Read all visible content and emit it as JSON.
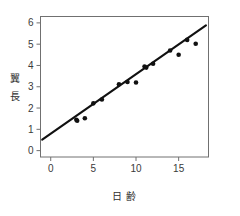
{
  "chart_data": {
    "type": "scatter",
    "title": "",
    "subtitle": "",
    "xlabel": "日 齢",
    "ylabel": "翼 長",
    "xlim": [
      -1.2,
      18.5
    ],
    "ylim": [
      -0.3,
      6.3
    ],
    "xticks": [
      0,
      5,
      10,
      15
    ],
    "xtick_labels": [
      "0",
      "5",
      "10",
      "15"
    ],
    "yticks": [
      0,
      1,
      2,
      3,
      4,
      5,
      6
    ],
    "ytick_labels": [
      "0",
      "1",
      "2",
      "3",
      "4",
      "5",
      "6"
    ],
    "grid": false,
    "legend": "none",
    "frame": "box",
    "marker": "filled-circle",
    "marker_color": "#111111",
    "line_color": "#111111",
    "axis_color": "#666666",
    "background": "#ffffff",
    "x": [
      3.0,
      3.1,
      4.0,
      5.0,
      6.0,
      8.0,
      9.0,
      10.0,
      11.0,
      11.2,
      12.0,
      14.0,
      15.0,
      16.0,
      17.0
    ],
    "y": [
      1.45,
      1.4,
      1.52,
      2.22,
      2.4,
      3.12,
      3.22,
      3.2,
      3.95,
      3.9,
      4.08,
      4.7,
      4.5,
      5.2,
      5.02
    ],
    "points": [
      {
        "x": 3.0,
        "y": 1.45
      },
      {
        "x": 3.1,
        "y": 1.4
      },
      {
        "x": 4.0,
        "y": 1.52
      },
      {
        "x": 5.0,
        "y": 2.22
      },
      {
        "x": 6.0,
        "y": 2.4
      },
      {
        "x": 8.0,
        "y": 3.12
      },
      {
        "x": 9.0,
        "y": 3.22
      },
      {
        "x": 10.0,
        "y": 3.2
      },
      {
        "x": 11.0,
        "y": 3.95
      },
      {
        "x": 11.2,
        "y": 3.9
      },
      {
        "x": 12.0,
        "y": 4.08
      },
      {
        "x": 14.0,
        "y": 4.7
      },
      {
        "x": 15.0,
        "y": 4.5
      },
      {
        "x": 16.0,
        "y": 5.2
      },
      {
        "x": 17.0,
        "y": 5.02
      }
    ],
    "series": [
      {
        "name": "observations",
        "type": "scatter",
        "values": [
          1.45,
          1.4,
          1.52,
          2.22,
          2.4,
          3.12,
          3.22,
          3.2,
          3.95,
          3.9,
          4.08,
          4.7,
          4.5,
          5.2,
          5.02
        ]
      },
      {
        "name": "regression-line",
        "type": "line",
        "x_endpoints": [
          -1.0,
          18.2
        ],
        "y_endpoints": [
          0.52,
          5.88
        ]
      }
    ],
    "regression": {
      "x_start": -1.0,
      "y_start": 0.52,
      "x_end": 18.2,
      "y_end": 5.88
    }
  }
}
